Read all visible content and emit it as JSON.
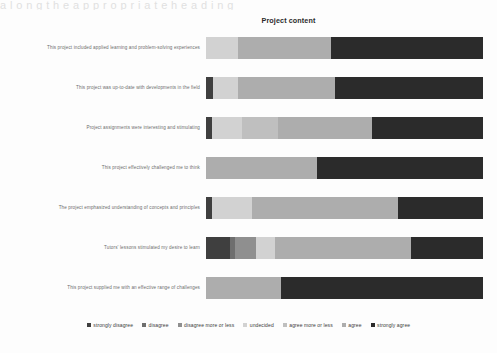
{
  "top_artifact_text": "a l o n g t h e a p p r o p r i a t e h e a d i n g",
  "chart_data": {
    "type": "bar",
    "subtype": "stacked-horizontal-100",
    "title": "Project content",
    "xlabel": "",
    "ylabel": "",
    "grid": false,
    "legend_position": "bottom",
    "xlim": [
      0,
      100
    ],
    "categories": [
      "This project included applied learning and problem-solving experiences",
      "This project was up-to-date with developments in the field",
      "Project assignments were interesting and stimulating",
      "This project effectively challenged me to think",
      "The project emphasized understanding of concepts and principles",
      "Tutors' lessons stimulated my desire to learn",
      "This project supplied me with an effective range of challenges"
    ],
    "series": [
      {
        "name": "strongly disagree",
        "color": "#3f3f3f",
        "values": [
          0.0,
          2.5,
          2.0,
          0.0,
          2.0,
          8.5,
          0.0
        ]
      },
      {
        "name": "disagree",
        "color": "#6e6e6e",
        "values": [
          0.0,
          0.0,
          0.0,
          0.0,
          0.0,
          2.0,
          0.0
        ]
      },
      {
        "name": "disagree more or less",
        "color": "#8f8f8f",
        "values": [
          0.0,
          0.0,
          0.0,
          0.0,
          0.0,
          7.5,
          0.0
        ]
      },
      {
        "name": "undecided",
        "color": "#d2d2d2",
        "values": [
          11.5,
          9.0,
          11.0,
          0.0,
          14.5,
          7.0,
          0.0
        ]
      },
      {
        "name": "agree more or less",
        "color": "#bfbfbf",
        "values": [
          0.0,
          0.0,
          13.0,
          0.0,
          0.0,
          0.0,
          0.0
        ]
      },
      {
        "name": "agree",
        "color": "#adadad",
        "values": [
          33.5,
          35.0,
          34.0,
          40.0,
          53.0,
          49.0,
          27.0
        ]
      },
      {
        "name": "strongly agree",
        "color": "#2b2b2b",
        "values": [
          55.0,
          53.5,
          40.0,
          60.0,
          30.5,
          26.0,
          73.0
        ]
      }
    ]
  }
}
